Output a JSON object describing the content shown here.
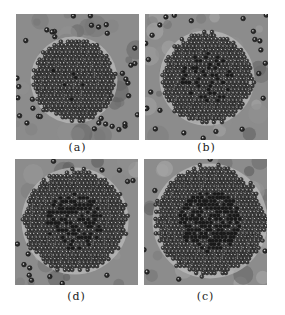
{
  "figure": {
    "panels": [
      {
        "id": "a",
        "label": "(a)",
        "cluster_radius": 42,
        "cx": 58,
        "cy": 66,
        "dark_core": 0.15,
        "stray_density": 1.0
      },
      {
        "id": "b",
        "label": "(b)",
        "cluster_radius": 46,
        "cx": 62,
        "cy": 64,
        "dark_core": 0.3,
        "stray_density": 0.8
      },
      {
        "id": "d",
        "label": "(d)",
        "cluster_radius": 52,
        "cx": 60,
        "cy": 62,
        "dark_core": 0.5,
        "stray_density": 0.7
      },
      {
        "id": "c",
        "label": "(c)",
        "cluster_radius": 56,
        "cx": 66,
        "cy": 62,
        "dark_core": 0.75,
        "stray_density": 0.5
      }
    ]
  }
}
